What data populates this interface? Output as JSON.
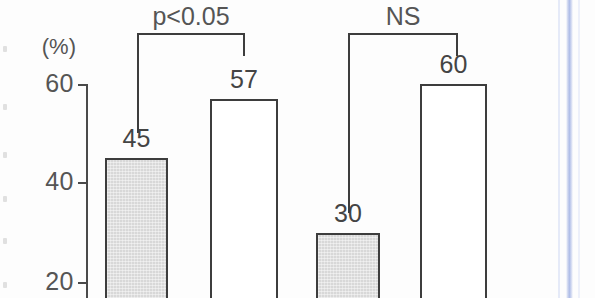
{
  "chart_data": {
    "type": "bar",
    "title": "",
    "subtitle": "",
    "xlabel": "",
    "ylabel": "",
    "unit_label": "(%)",
    "grid": false,
    "legend_position": "none",
    "ylim": [
      20,
      65
    ],
    "y_ticks": [
      {
        "value": 60,
        "label": "60"
      },
      {
        "value": 40,
        "label": "40"
      },
      {
        "value": 20,
        "label": "20"
      }
    ],
    "y_axis_note": "bars are cropped at the bottom of the image; axis continues below 20",
    "categories": [
      "bar-1",
      "bar-2",
      "bar-3",
      "bar-4"
    ],
    "values": [
      45,
      57,
      30,
      60
    ],
    "bars": [
      {
        "label": "45",
        "value": 45,
        "fill": "shaded",
        "group": 1
      },
      {
        "label": "57",
        "value": 57,
        "fill": "open",
        "group": 1
      },
      {
        "label": "30",
        "value": 30,
        "fill": "shaded",
        "group": 2
      },
      {
        "label": "60",
        "value": 60,
        "fill": "open",
        "group": 2
      }
    ],
    "annotations": [
      {
        "text": "p<0.05",
        "group": 1,
        "spans": [
          "bar-1",
          "bar-2"
        ]
      },
      {
        "text": "NS",
        "group": 2,
        "spans": [
          "bar-3",
          "bar-4"
        ]
      }
    ],
    "colors": {
      "shaded_fill": "#d8d8d8",
      "open_fill": "#ffffff",
      "outline": "#3d3d3d",
      "axis": "#4a4a4a",
      "text": "#555555",
      "scan_stripe": "#aab9e6"
    }
  }
}
